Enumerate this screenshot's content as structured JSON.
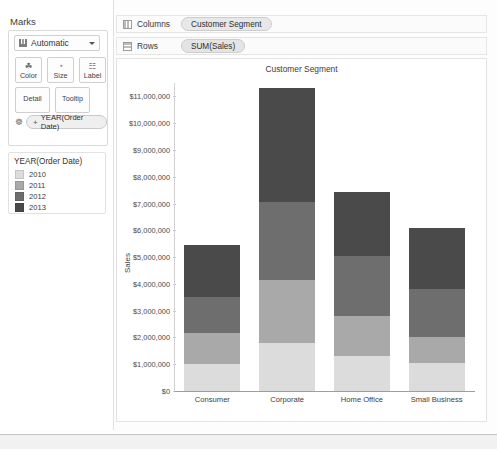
{
  "marks": {
    "title": "Marks",
    "mark_type": {
      "label": "Automatic",
      "icon": "bar-chart-icon",
      "caret": "chevron-down-icon"
    },
    "buttons": [
      {
        "label": "Color",
        "icon": "color-palette-icon",
        "glyph": "☘"
      },
      {
        "label": "Size",
        "icon": "size-icon",
        "glyph": "◔"
      },
      {
        "label": "Label",
        "icon": "label-icon",
        "glyph": "☷"
      },
      {
        "label": "Detail",
        "icon": "detail-icon",
        "glyph": ""
      },
      {
        "label": "Tooltip",
        "icon": "tooltip-icon",
        "glyph": ""
      }
    ],
    "field_pill": {
      "label": "YEAR(Order Date)",
      "plus": "+",
      "icon": "color-palette-icon"
    }
  },
  "legend": {
    "title": "YEAR(Order Date)",
    "items": [
      {
        "label": "2010",
        "color": "#dcdcdc"
      },
      {
        "label": "2011",
        "color": "#a9a9a9"
      },
      {
        "label": "2012",
        "color": "#6e6e6e"
      },
      {
        "label": "2013",
        "color": "#4a4a4a"
      }
    ]
  },
  "shelves": {
    "columns": {
      "name": "Columns",
      "pill": "Customer Segment"
    },
    "rows": {
      "name": "Rows",
      "pill": "SUM(Sales)"
    }
  },
  "chart_data": {
    "type": "bar",
    "stacked": true,
    "title": "Customer Segment",
    "xlabel": "",
    "ylabel": "Sales",
    "ylim": [
      0,
      11500000
    ],
    "ytick_values": [
      0,
      1000000,
      2000000,
      3000000,
      4000000,
      5000000,
      6000000,
      7000000,
      8000000,
      9000000,
      10000000,
      11000000
    ],
    "ytick_labels": [
      "$0",
      "$1,000,000",
      "$2,000,000",
      "$3,000,000",
      "$4,000,000",
      "$5,000,000",
      "$6,000,000",
      "$7,000,000",
      "$8,000,000",
      "$9,000,000",
      "$10,000,000",
      "$11,000,000"
    ],
    "categories": [
      "Consumer",
      "Corporate",
      "Home Office",
      "Small Business"
    ],
    "grid": false,
    "legend_position": "left-panel",
    "series": [
      {
        "name": "2010",
        "color": "#dcdcdc",
        "values": [
          1000000,
          1800000,
          1300000,
          1050000
        ]
      },
      {
        "name": "2011",
        "color": "#a9a9a9",
        "values": [
          1150000,
          2350000,
          1500000,
          950000
        ]
      },
      {
        "name": "2012",
        "color": "#6e6e6e",
        "values": [
          1350000,
          2900000,
          2250000,
          1800000
        ]
      },
      {
        "name": "2013",
        "color": "#4a4a4a",
        "values": [
          1950000,
          4250000,
          2400000,
          2300000
        ]
      }
    ],
    "totals": [
      5450000,
      11300000,
      7450000,
      6100000
    ]
  }
}
